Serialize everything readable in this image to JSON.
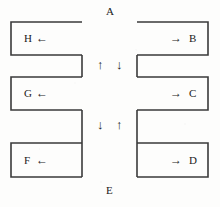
{
  "figure": {
    "title": "",
    "background_color": "#fdfdfc",
    "stroke_color": "#3a3a3a",
    "text_color": "#1a1a1a",
    "stroke_width": 1.6
  },
  "labels": {
    "top": "A",
    "bottom": "E",
    "left_top": "H",
    "left_middle": "G",
    "left_bottom": "F",
    "right_top": "B",
    "right_middle": "C",
    "right_bottom": "D"
  },
  "edge_arrows": [
    {
      "name": "arrow-h-left",
      "glyph": "←",
      "direction": "left",
      "label": "H"
    },
    {
      "name": "arrow-g-left",
      "glyph": "←",
      "direction": "left",
      "label": "G"
    },
    {
      "name": "arrow-f-left",
      "glyph": "←",
      "direction": "left",
      "label": "F"
    },
    {
      "name": "arrow-b-right",
      "glyph": "→",
      "direction": "right",
      "label": "B"
    },
    {
      "name": "arrow-c-right",
      "glyph": "→",
      "direction": "right",
      "label": "C"
    },
    {
      "name": "arrow-d-right",
      "glyph": "→",
      "direction": "right",
      "label": "D"
    }
  ],
  "center_arrows": [
    {
      "name": "arrow-upper-left-up",
      "glyph": "↑",
      "direction": "up"
    },
    {
      "name": "arrow-upper-right-down",
      "glyph": "↓",
      "direction": "down"
    },
    {
      "name": "arrow-lower-left-down",
      "glyph": "↓",
      "direction": "down"
    },
    {
      "name": "arrow-lower-right-up",
      "glyph": "↑",
      "direction": "up"
    }
  ],
  "shapes": {
    "left_comb_points": "11,22 82,22 82,55 11,55 11,77 82,77 82,110 11,110 11,143 82,143 82,177 11,177",
    "right_comb_points": "208,22 137,22 137,55 208,55 208,77 137,77 137,110 208,110 208,143 137,143 137,177 208,177"
  }
}
